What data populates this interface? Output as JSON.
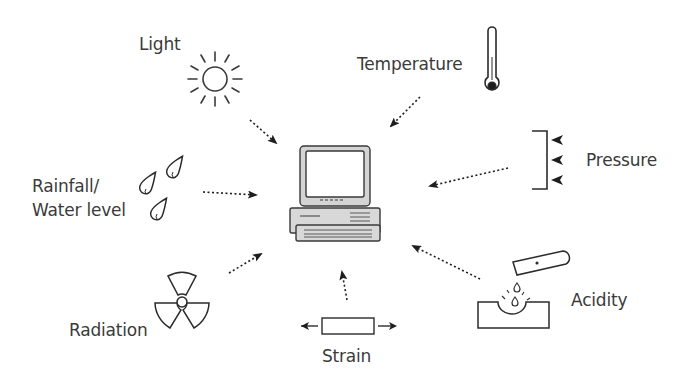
{
  "diagram": {
    "type": "sensor-input-diagram",
    "center": {
      "label": "",
      "icon": "computer-icon"
    },
    "sensors": [
      {
        "id": "light",
        "label": "Light",
        "icon": "sun-icon"
      },
      {
        "id": "temperature",
        "label": "Temperature",
        "icon": "thermometer-icon"
      },
      {
        "id": "pressure",
        "label": "Pressure",
        "icon": "pressure-plate-icon"
      },
      {
        "id": "rainfall",
        "label_line1": "Rainfall/",
        "label_line2": "Water level",
        "icon": "raindrops-icon"
      },
      {
        "id": "radiation",
        "label": "Radiation",
        "icon": "radiation-icon"
      },
      {
        "id": "strain",
        "label": "Strain",
        "icon": "strain-bar-icon"
      },
      {
        "id": "acidity",
        "label": "Acidity",
        "icon": "acid-dropper-icon"
      }
    ],
    "arrows": [
      {
        "from": "light",
        "to": "computer",
        "style": "dotted"
      },
      {
        "from": "temperature",
        "to": "computer",
        "style": "dotted"
      },
      {
        "from": "pressure",
        "to": "computer",
        "style": "dotted"
      },
      {
        "from": "rainfall",
        "to": "computer",
        "style": "dotted"
      },
      {
        "from": "radiation",
        "to": "computer",
        "style": "dotted"
      },
      {
        "from": "strain",
        "to": "computer",
        "style": "dotted"
      },
      {
        "from": "acidity",
        "to": "computer",
        "style": "dotted"
      }
    ],
    "colors": {
      "stroke": "#2b2b2b",
      "text": "#3a3a3a",
      "computer_fill": "#d8d8d8",
      "background": "#ffffff"
    }
  }
}
